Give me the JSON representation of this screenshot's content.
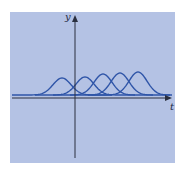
{
  "figure": {
    "background_color": "#b4c2e4",
    "curve_color": "#2f55a8",
    "axis_color": "#2a2f3f",
    "y_axis_label": "y",
    "x_axis_label": "t"
  },
  "chart_data": {
    "type": "line",
    "title": "",
    "xlabel": "t",
    "ylabel": "y",
    "series": [
      {
        "name": "bump-1",
        "center_px": 62,
        "peak_px": 78
      },
      {
        "name": "bump-2",
        "center_px": 85,
        "peak_px": 77
      },
      {
        "name": "bump-3",
        "center_px": 103,
        "peak_px": 74
      },
      {
        "name": "bump-4",
        "center_px": 120,
        "peak_px": 73
      },
      {
        "name": "bump-5",
        "center_px": 138,
        "peak_px": 72
      }
    ],
    "baseline_px": 95,
    "grid": false,
    "legend": null
  }
}
